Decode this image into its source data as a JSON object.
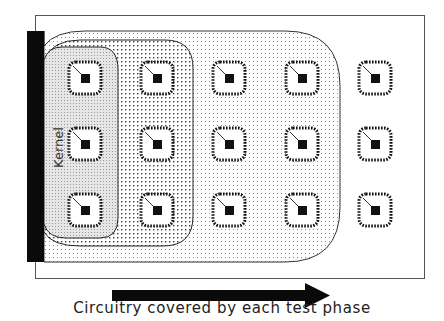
{
  "diagram": {
    "caption": "Circuitry covered by each test phase",
    "kernel_label": "Kernel",
    "regions": [
      {
        "name": "kernel",
        "label": "Kernel",
        "fill": "dense-gray-dots",
        "columns_covered": 1
      },
      {
        "name": "phase-2",
        "label": "",
        "fill": "medium-dots",
        "columns_covered": 2
      },
      {
        "name": "phase-3",
        "label": "",
        "fill": "light-dots",
        "columns_covered": 4
      }
    ],
    "chip_grid": {
      "rows": 3,
      "columns": 5,
      "column_centers_x": [
        85,
        157,
        229,
        302,
        375
      ],
      "row_centers_y": [
        78,
        144,
        210
      ]
    },
    "arrow": {
      "direction": "right",
      "meaning": "Circuitry covered by each test phase"
    },
    "colors": {
      "ink": "#111111",
      "frame": "#555555",
      "kernel_fill": "#e4e4e4",
      "dot": "#444444",
      "background": "#ffffff"
    }
  }
}
